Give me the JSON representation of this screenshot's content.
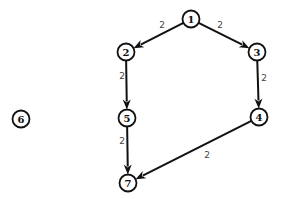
{
  "graph": {
    "type": "directed-weighted-graph",
    "nodes": [
      {
        "id": "1",
        "label": "1"
      },
      {
        "id": "2",
        "label": "2"
      },
      {
        "id": "3",
        "label": "3"
      },
      {
        "id": "4",
        "label": "4"
      },
      {
        "id": "5",
        "label": "5"
      },
      {
        "id": "6",
        "label": "6"
      },
      {
        "id": "7",
        "label": "7"
      }
    ],
    "edges": [
      {
        "from": "1",
        "to": "2",
        "weight": "2"
      },
      {
        "from": "1",
        "to": "3",
        "weight": "2"
      },
      {
        "from": "2",
        "to": "5",
        "weight": "2"
      },
      {
        "from": "3",
        "to": "4",
        "weight": "2"
      },
      {
        "from": "5",
        "to": "7",
        "weight": "2"
      },
      {
        "from": "4",
        "to": "7",
        "weight": "2"
      }
    ],
    "colors": {
      "stroke": "#111111",
      "edge_label": "#444444",
      "background": "#ffffff"
    }
  }
}
